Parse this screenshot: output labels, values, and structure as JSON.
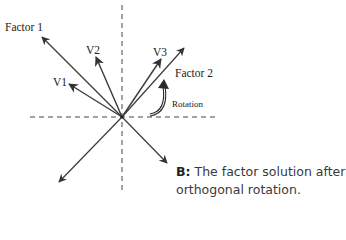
{
  "diagram": {
    "colors": {
      "line": "#3a3a3a",
      "dash": "#444444",
      "text": "#222222"
    },
    "axes": {
      "style": "dashed",
      "horizontal": "y=117",
      "vertical": "x=122"
    },
    "vectors": [
      {
        "id": "factor1",
        "label": "Factor 1"
      },
      {
        "id": "v2",
        "label": "V2"
      },
      {
        "id": "v1",
        "label": "V1"
      },
      {
        "id": "v3",
        "label": "V3"
      },
      {
        "id": "factor2",
        "label": "Factor 2"
      },
      {
        "id": "factor1-neg",
        "label": ""
      },
      {
        "id": "factor2-neg",
        "label": ""
      }
    ],
    "rotation_label": "Rotation",
    "caption": {
      "prefix": "B:",
      "text": "The factor solution after",
      "text2": "orthogonal rotation."
    }
  }
}
